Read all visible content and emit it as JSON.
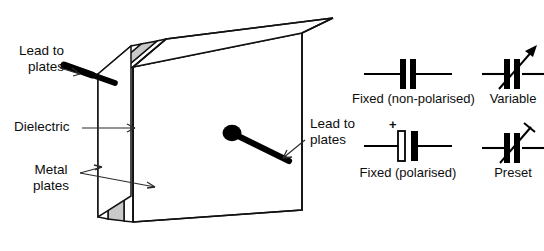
{
  "diagram": {
    "callouts": [
      {
        "id": "lead-left",
        "text": "Lead to\nplates"
      },
      {
        "id": "dielectric",
        "text": "Dielectric"
      },
      {
        "id": "metal",
        "text": "Metal\nplates"
      },
      {
        "id": "lead-right",
        "text": "Lead to\nplates"
      }
    ],
    "symbols": [
      {
        "id": "fixed-non-polarised",
        "caption": "Fixed (non-polarised)",
        "plus_sign": ""
      },
      {
        "id": "variable",
        "caption": "Variable",
        "plus_sign": ""
      },
      {
        "id": "fixed-polarised",
        "caption": "Fixed (polarised)",
        "plus_sign": "+"
      },
      {
        "id": "preset",
        "caption": "Preset",
        "plus_sign": ""
      }
    ],
    "colors": {
      "ink": "#0d0d0d",
      "outline": "#111111",
      "dielectric_fill": "#c9c9c9",
      "body_fill": "#ffffff",
      "background": "#ffffff",
      "lead": "#000000"
    }
  }
}
